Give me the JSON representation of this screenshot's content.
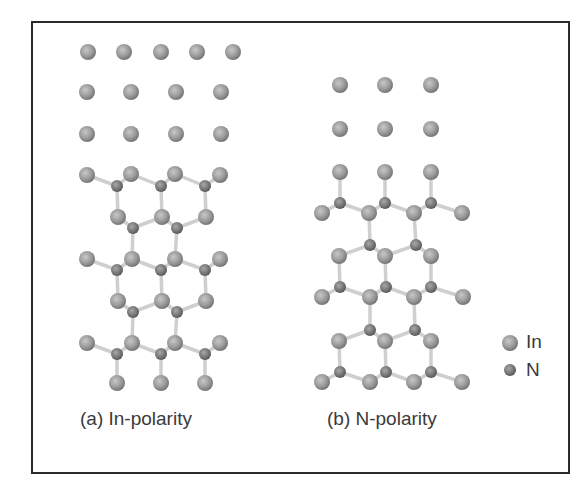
{
  "figure": {
    "captions": {
      "a": "(a) In-polarity",
      "b": "(b) N-polarity"
    },
    "legend": [
      {
        "label": "In",
        "species": "In"
      },
      {
        "label": "N",
        "species": "N"
      }
    ],
    "colors": {
      "frame": "#2b2b2b",
      "in_atom": "#9a9a9a",
      "n_atom": "#7a7a7a",
      "bond": "#cfcfcf",
      "text": "#3a3a3a"
    },
    "atom_radius": {
      "In": 8,
      "N": 6
    },
    "structures": [
      {
        "name": "in-polarity",
        "atoms": [
          {
            "s": "In",
            "x": 88,
            "y": 52
          },
          {
            "s": "In",
            "x": 124,
            "y": 52
          },
          {
            "s": "In",
            "x": 161,
            "y": 52
          },
          {
            "s": "In",
            "x": 197,
            "y": 52
          },
          {
            "s": "In",
            "x": 233,
            "y": 52
          },
          {
            "s": "In",
            "x": 87,
            "y": 92
          },
          {
            "s": "In",
            "x": 131,
            "y": 92
          },
          {
            "s": "In",
            "x": 176,
            "y": 92
          },
          {
            "s": "In",
            "x": 221,
            "y": 92
          },
          {
            "s": "In",
            "x": 87,
            "y": 134
          },
          {
            "s": "In",
            "x": 131,
            "y": 134
          },
          {
            "s": "In",
            "x": 176,
            "y": 134
          },
          {
            "s": "In",
            "x": 221,
            "y": 134
          },
          {
            "s": "In",
            "x": 87,
            "y": 175
          },
          {
            "s": "In",
            "x": 131,
            "y": 174
          },
          {
            "s": "In",
            "x": 175,
            "y": 174
          },
          {
            "s": "In",
            "x": 220,
            "y": 175
          },
          {
            "s": "N",
            "x": 117,
            "y": 186
          },
          {
            "s": "N",
            "x": 161,
            "y": 186
          },
          {
            "s": "N",
            "x": 205,
            "y": 186
          },
          {
            "s": "In",
            "x": 118,
            "y": 217
          },
          {
            "s": "In",
            "x": 162,
            "y": 217
          },
          {
            "s": "In",
            "x": 206,
            "y": 217
          },
          {
            "s": "N",
            "x": 133,
            "y": 228
          },
          {
            "s": "N",
            "x": 177,
            "y": 228
          },
          {
            "s": "In",
            "x": 87,
            "y": 259
          },
          {
            "s": "In",
            "x": 132,
            "y": 259
          },
          {
            "s": "In",
            "x": 175,
            "y": 259
          },
          {
            "s": "In",
            "x": 220,
            "y": 259
          },
          {
            "s": "N",
            "x": 117,
            "y": 270
          },
          {
            "s": "N",
            "x": 161,
            "y": 270
          },
          {
            "s": "N",
            "x": 205,
            "y": 270
          },
          {
            "s": "In",
            "x": 118,
            "y": 301
          },
          {
            "s": "In",
            "x": 162,
            "y": 301
          },
          {
            "s": "In",
            "x": 206,
            "y": 301
          },
          {
            "s": "N",
            "x": 133,
            "y": 312
          },
          {
            "s": "N",
            "x": 177,
            "y": 312
          },
          {
            "s": "In",
            "x": 87,
            "y": 343
          },
          {
            "s": "In",
            "x": 132,
            "y": 343
          },
          {
            "s": "In",
            "x": 175,
            "y": 343
          },
          {
            "s": "In",
            "x": 220,
            "y": 343
          },
          {
            "s": "N",
            "x": 117,
            "y": 354
          },
          {
            "s": "N",
            "x": 161,
            "y": 354
          },
          {
            "s": "N",
            "x": 205,
            "y": 354
          },
          {
            "s": "In",
            "x": 117,
            "y": 383
          },
          {
            "s": "In",
            "x": 161,
            "y": 383
          },
          {
            "s": "In",
            "x": 205,
            "y": 383
          }
        ],
        "bonds": [
          [
            87,
            175,
            117,
            186
          ],
          [
            131,
            174,
            117,
            186
          ],
          [
            131,
            174,
            161,
            186
          ],
          [
            175,
            174,
            161,
            186
          ],
          [
            175,
            174,
            205,
            186
          ],
          [
            220,
            175,
            205,
            186
          ],
          [
            117,
            186,
            118,
            217
          ],
          [
            161,
            186,
            162,
            217
          ],
          [
            205,
            186,
            206,
            217
          ],
          [
            118,
            217,
            133,
            228
          ],
          [
            162,
            217,
            133,
            228
          ],
          [
            162,
            217,
            177,
            228
          ],
          [
            206,
            217,
            177,
            228
          ],
          [
            133,
            228,
            132,
            259
          ],
          [
            177,
            228,
            175,
            259
          ],
          [
            87,
            259,
            117,
            270
          ],
          [
            132,
            259,
            117,
            270
          ],
          [
            132,
            259,
            161,
            270
          ],
          [
            175,
            259,
            161,
            270
          ],
          [
            175,
            259,
            205,
            270
          ],
          [
            220,
            259,
            205,
            270
          ],
          [
            117,
            270,
            118,
            301
          ],
          [
            161,
            270,
            162,
            301
          ],
          [
            205,
            270,
            206,
            301
          ],
          [
            118,
            301,
            133,
            312
          ],
          [
            162,
            301,
            133,
            312
          ],
          [
            162,
            301,
            177,
            312
          ],
          [
            206,
            301,
            177,
            312
          ],
          [
            133,
            312,
            132,
            343
          ],
          [
            177,
            312,
            175,
            343
          ],
          [
            87,
            343,
            117,
            354
          ],
          [
            132,
            343,
            117,
            354
          ],
          [
            132,
            343,
            161,
            354
          ],
          [
            175,
            343,
            161,
            354
          ],
          [
            175,
            343,
            205,
            354
          ],
          [
            220,
            343,
            205,
            354
          ],
          [
            117,
            354,
            117,
            383
          ],
          [
            161,
            354,
            161,
            383
          ],
          [
            205,
            354,
            205,
            383
          ]
        ]
      },
      {
        "name": "n-polarity",
        "atoms": [
          {
            "s": "In",
            "x": 340,
            "y": 85
          },
          {
            "s": "In",
            "x": 385,
            "y": 85
          },
          {
            "s": "In",
            "x": 431,
            "y": 85
          },
          {
            "s": "In",
            "x": 340,
            "y": 129
          },
          {
            "s": "In",
            "x": 385,
            "y": 129
          },
          {
            "s": "In",
            "x": 431,
            "y": 129
          },
          {
            "s": "In",
            "x": 340,
            "y": 172
          },
          {
            "s": "In",
            "x": 385,
            "y": 172
          },
          {
            "s": "In",
            "x": 431,
            "y": 172
          },
          {
            "s": "N",
            "x": 340,
            "y": 203
          },
          {
            "s": "N",
            "x": 385,
            "y": 203
          },
          {
            "s": "N",
            "x": 431,
            "y": 203
          },
          {
            "s": "In",
            "x": 322,
            "y": 213
          },
          {
            "s": "In",
            "x": 369,
            "y": 213
          },
          {
            "s": "In",
            "x": 414,
            "y": 213
          },
          {
            "s": "In",
            "x": 462,
            "y": 213
          },
          {
            "s": "N",
            "x": 370,
            "y": 245
          },
          {
            "s": "N",
            "x": 416,
            "y": 245
          },
          {
            "s": "In",
            "x": 339,
            "y": 256
          },
          {
            "s": "In",
            "x": 385,
            "y": 256
          },
          {
            "s": "In",
            "x": 431,
            "y": 256
          },
          {
            "s": "N",
            "x": 340,
            "y": 287
          },
          {
            "s": "N",
            "x": 386,
            "y": 287
          },
          {
            "s": "N",
            "x": 431,
            "y": 287
          },
          {
            "s": "In",
            "x": 322,
            "y": 297
          },
          {
            "s": "In",
            "x": 370,
            "y": 297
          },
          {
            "s": "In",
            "x": 414,
            "y": 297
          },
          {
            "s": "In",
            "x": 463,
            "y": 297
          },
          {
            "s": "N",
            "x": 370,
            "y": 330
          },
          {
            "s": "N",
            "x": 415,
            "y": 330
          },
          {
            "s": "In",
            "x": 339,
            "y": 341
          },
          {
            "s": "In",
            "x": 385,
            "y": 341
          },
          {
            "s": "In",
            "x": 431,
            "y": 341
          },
          {
            "s": "N",
            "x": 340,
            "y": 372
          },
          {
            "s": "N",
            "x": 386,
            "y": 372
          },
          {
            "s": "N",
            "x": 431,
            "y": 372
          },
          {
            "s": "In",
            "x": 322,
            "y": 382
          },
          {
            "s": "In",
            "x": 370,
            "y": 382
          },
          {
            "s": "In",
            "x": 414,
            "y": 382
          },
          {
            "s": "In",
            "x": 462,
            "y": 382
          }
        ],
        "bonds": [
          [
            340,
            172,
            340,
            203
          ],
          [
            385,
            172,
            385,
            203
          ],
          [
            431,
            172,
            431,
            203
          ],
          [
            340,
            203,
            322,
            213
          ],
          [
            340,
            203,
            369,
            213
          ],
          [
            385,
            203,
            369,
            213
          ],
          [
            385,
            203,
            414,
            213
          ],
          [
            431,
            203,
            414,
            213
          ],
          [
            431,
            203,
            462,
            213
          ],
          [
            369,
            213,
            370,
            245
          ],
          [
            414,
            213,
            416,
            245
          ],
          [
            370,
            245,
            339,
            256
          ],
          [
            370,
            245,
            385,
            256
          ],
          [
            416,
            245,
            385,
            256
          ],
          [
            416,
            245,
            431,
            256
          ],
          [
            339,
            256,
            340,
            287
          ],
          [
            385,
            256,
            386,
            287
          ],
          [
            431,
            256,
            431,
            287
          ],
          [
            340,
            287,
            322,
            297
          ],
          [
            340,
            287,
            370,
            297
          ],
          [
            386,
            287,
            370,
            297
          ],
          [
            386,
            287,
            414,
            297
          ],
          [
            431,
            287,
            414,
            297
          ],
          [
            431,
            287,
            463,
            297
          ],
          [
            370,
            297,
            370,
            330
          ],
          [
            414,
            297,
            415,
            330
          ],
          [
            370,
            330,
            339,
            341
          ],
          [
            370,
            330,
            385,
            341
          ],
          [
            415,
            330,
            385,
            341
          ],
          [
            415,
            330,
            431,
            341
          ],
          [
            339,
            341,
            340,
            372
          ],
          [
            385,
            341,
            386,
            372
          ],
          [
            431,
            341,
            431,
            372
          ],
          [
            340,
            372,
            322,
            382
          ],
          [
            340,
            372,
            370,
            382
          ],
          [
            386,
            372,
            370,
            382
          ],
          [
            386,
            372,
            414,
            382
          ],
          [
            431,
            372,
            414,
            382
          ],
          [
            431,
            372,
            462,
            382
          ]
        ]
      }
    ],
    "legend_positions": [
      {
        "x": 510,
        "y": 343
      },
      {
        "x": 510,
        "y": 370
      }
    ]
  }
}
